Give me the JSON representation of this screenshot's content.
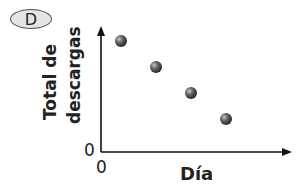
{
  "label": "D",
  "chart_data": {
    "type": "scatter",
    "title": "",
    "xlabel": "Día",
    "ylabel": "Total de descargas",
    "x_origin_label": "0",
    "y_origin_label": "0",
    "points": [
      {
        "x": 1,
        "y": 4
      },
      {
        "x": 2,
        "y": 3
      },
      {
        "x": 3,
        "y": 2
      },
      {
        "x": 4,
        "y": 1
      }
    ],
    "grid": false,
    "legend": null
  }
}
